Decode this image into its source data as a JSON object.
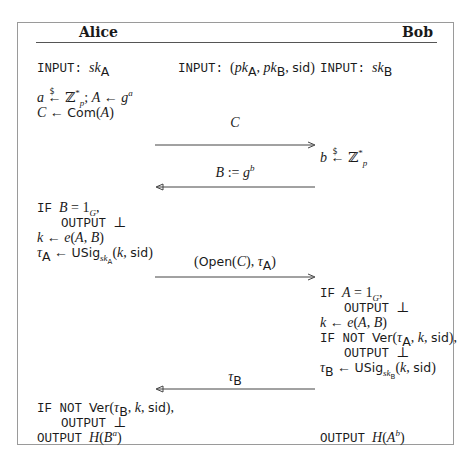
{
  "parties": {
    "alice": "Alice",
    "bob": "Bob"
  },
  "inputs": {
    "keyword": "INPUT:",
    "alice": "sk_A",
    "common": "(pk_A, pk_B, sid)",
    "bob": "sk_B"
  },
  "keywords": {
    "if": "IF",
    "if_not": "IF NOT",
    "output": "OUTPUT",
    "bottom": "⊥"
  },
  "alice_steps": {
    "setup_1": "a ←$ Z_p^*; A ← g^a",
    "setup_2": "C ← Com(A)",
    "check_1": "B = 1_G,",
    "check_1_out": "⊥",
    "key": "k ← e(A, B)",
    "sign": "τ_A ← USig_{sk_A}(k, sid)",
    "verify": "Ver(τ_B, k, sid),",
    "verify_out": "⊥",
    "final": "H(B^a)"
  },
  "bob_steps": {
    "sample": "b ←$ Z_p^*",
    "check_1": "A = 1_G,",
    "check_1_out": "⊥",
    "key": "k ← e(A, B)",
    "verify": "Ver(τ_A, k, sid),",
    "verify_out": "⊥",
    "sign": "τ_B ← USig_{sk_B}(k, sid)",
    "final": "H(A^b)"
  },
  "messages": [
    {
      "label": "C",
      "direction": "right"
    },
    {
      "label": "B := g^b",
      "direction": "left"
    },
    {
      "label": "(Open(C), τ_A)",
      "direction": "right"
    },
    {
      "label": "τ_B",
      "direction": "left"
    }
  ]
}
